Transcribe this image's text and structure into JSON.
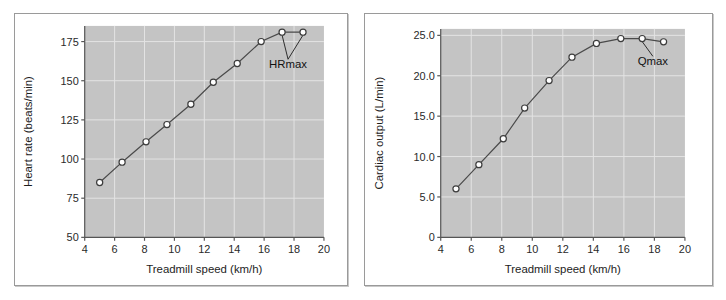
{
  "figure": {
    "panels": [
      "heart-rate-panel",
      "cardiac-output-panel"
    ]
  },
  "chart_data": [
    {
      "type": "line",
      "id": "heart-rate-vs-speed",
      "title": "",
      "xlabel": "Treadmill speed (km/h)",
      "ylabel": "Heart rate (beats/min)",
      "xlim": [
        4,
        20
      ],
      "ylim": [
        50,
        185
      ],
      "xticks": [
        4,
        6,
        8,
        10,
        12,
        14,
        16,
        18,
        20
      ],
      "xticklabels": [
        "4",
        "6",
        "8",
        "10",
        "12",
        "14",
        "16",
        "18",
        "20"
      ],
      "yticks": [
        50,
        75,
        100,
        125,
        150,
        175
      ],
      "yticklabels": [
        "50",
        "75",
        "100",
        "125",
        "150",
        "175"
      ],
      "grid": true,
      "legend": "none",
      "plot_background": "#c4c4c4",
      "marker": "open-circle",
      "x": [
        5.0,
        6.5,
        8.1,
        9.5,
        11.1,
        12.6,
        14.2,
        15.8,
        17.2,
        18.6
      ],
      "values": [
        85,
        98,
        111,
        122,
        135,
        149,
        161,
        175,
        181,
        181
      ],
      "annotations": [
        {
          "text": "HRmax",
          "x": 17.6,
          "y": 158,
          "points_to": [
            [
              17.2,
              181
            ],
            [
              18.6,
              181
            ]
          ]
        }
      ]
    },
    {
      "type": "line",
      "id": "cardiac-output-vs-speed",
      "title": "",
      "xlabel": "Treadmill speed (km/h)",
      "ylabel": "Cardiac output (L/min)",
      "xlim": [
        4,
        20
      ],
      "ylim": [
        0,
        25.8
      ],
      "xticks": [
        4,
        6,
        8,
        10,
        12,
        14,
        16,
        18,
        20
      ],
      "xticklabels": [
        "4",
        "6",
        "8",
        "10",
        "12",
        "14",
        "16",
        "18",
        "20"
      ],
      "yticks": [
        0,
        5.0,
        10.0,
        15.0,
        20.0,
        25.0
      ],
      "yticklabels": [
        "0",
        "5.0",
        "10.0",
        "15.0",
        "20.0",
        "25.0"
      ],
      "grid": true,
      "legend": "none",
      "plot_background": "#c4c4c4",
      "marker": "open-circle",
      "x": [
        5.0,
        6.5,
        8.1,
        9.5,
        11.1,
        12.6,
        14.2,
        15.8,
        17.2,
        18.6
      ],
      "values": [
        6.0,
        9.0,
        12.2,
        16.0,
        19.4,
        22.3,
        24.0,
        24.6,
        24.6,
        24.2
      ],
      "annotations": [
        {
          "text": "Qmax",
          "x": 17.9,
          "y": 21.3,
          "points_to": [
            [
              17.2,
              24.6
            ]
          ]
        }
      ]
    }
  ]
}
